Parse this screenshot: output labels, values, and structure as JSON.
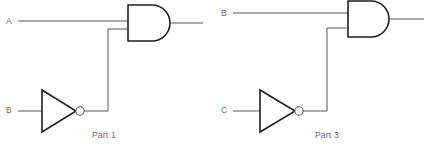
{
  "page": {
    "background_color": "#ffffff",
    "line_color": "#57585a",
    "gate_outline_color": "#231f20",
    "text_color": "#6d6e70",
    "width": 429,
    "height": 156
  },
  "circuits": [
    {
      "id": "part-1",
      "caption": "Part 1",
      "inputs": [
        {
          "label": "A",
          "role": "direct-input-to-and-gate"
        },
        {
          "label": "B",
          "role": "inverted-input-to-and-gate"
        }
      ],
      "gates": [
        {
          "type": "and-gate",
          "name": "and-gate",
          "inputs": 2,
          "outputs": 1
        },
        {
          "type": "not-gate",
          "name": "inverter",
          "inputs": 1,
          "outputs": 1,
          "has_bubble": true
        }
      ],
      "output": {
        "label": "",
        "role": "and-gate-output"
      }
    },
    {
      "id": "part-3",
      "caption": "Part 3",
      "inputs": [
        {
          "label": "B",
          "role": "direct-input-to-and-gate"
        },
        {
          "label": "C",
          "role": "inverted-input-to-and-gate"
        }
      ],
      "gates": [
        {
          "type": "and-gate",
          "name": "and-gate",
          "inputs": 2,
          "outputs": 1
        },
        {
          "type": "not-gate",
          "name": "inverter",
          "inputs": 1,
          "outputs": 1,
          "has_bubble": true
        }
      ],
      "output": {
        "label": "",
        "role": "and-gate-output"
      }
    }
  ]
}
